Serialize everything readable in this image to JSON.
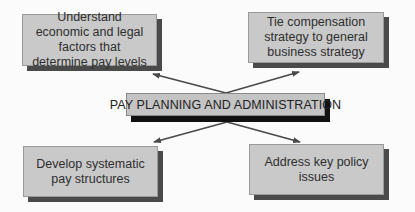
{
  "diagram": {
    "center": {
      "label": "PAY PLANNING AND ADMINISTRATION"
    },
    "nodes": [
      {
        "id": "top-left",
        "label": "Understand economic and legal factors that determine pay levels"
      },
      {
        "id": "top-right",
        "label": "Tie compensation strategy to general business strategy"
      },
      {
        "id": "bottom-left",
        "label": "Develop systematic pay structures"
      },
      {
        "id": "bottom-right",
        "label": "Address key policy issues"
      }
    ],
    "edges": [
      {
        "from": "center",
        "to": "top-left"
      },
      {
        "from": "center",
        "to": "top-right"
      },
      {
        "from": "center",
        "to": "bottom-left"
      },
      {
        "from": "center",
        "to": "bottom-right"
      }
    ],
    "colors": {
      "box_fill": "#c9c9c9",
      "box_shadow": "#4a4a4a",
      "center_shadow": "#111111",
      "arrow": "#4a4a4a",
      "text": "#2e2e2e"
    }
  }
}
